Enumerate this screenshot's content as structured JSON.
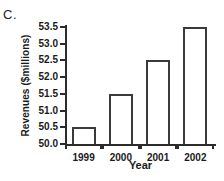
{
  "panel": {
    "label": "C."
  },
  "chart_data": {
    "type": "bar",
    "title": "",
    "subtitle": "",
    "xlabel": "Year",
    "ylabel": "Revenues ($millions)",
    "categories": [
      "1999",
      "2000",
      "2001",
      "2002"
    ],
    "values": [
      50.5,
      51.5,
      52.5,
      53.5
    ],
    "series": [
      {
        "name": "Revenues",
        "values": [
          50.5,
          51.5,
          52.5,
          53.5
        ]
      }
    ],
    "ylim": [
      50.0,
      53.5
    ],
    "xlim": [
      0,
      4
    ],
    "yticks": [
      50.0,
      50.5,
      51.0,
      51.5,
      52.0,
      52.5,
      53.0,
      53.5
    ],
    "ytick_labels": [
      "50.0",
      "50.5",
      "51.0",
      "51.5",
      "52.0",
      "52.5",
      "53.0",
      "53.5"
    ],
    "xtick_labels": [
      "1999",
      "2000",
      "2001",
      "2002"
    ],
    "grid": false,
    "legend": false,
    "legend_position": "none",
    "bar_fill_color": "#ffffff",
    "bar_edge_color": "#3a3a3a",
    "axis_color": "#2b2b2b",
    "background_color": "#ffffff",
    "annotations": []
  }
}
